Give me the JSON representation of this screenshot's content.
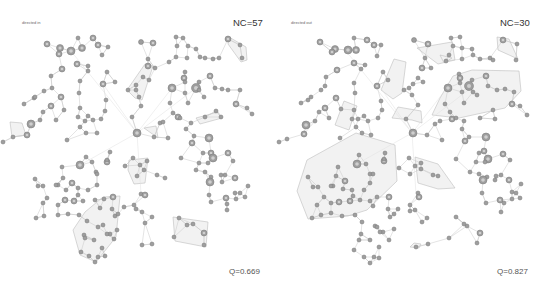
{
  "panels": [
    {
      "title": "directed in",
      "nc_label": "NC=57",
      "q_label": "Q=0.669",
      "hulls": [
        [
          [
            229,
            37
          ],
          [
            246,
            47
          ],
          [
            247,
            60
          ],
          [
            241,
            62
          ],
          [
            228,
            44
          ]
        ],
        [
          [
            145,
            64
          ],
          [
            153,
            66
          ],
          [
            142,
            100
          ],
          [
            135,
            98
          ],
          [
            127,
            90
          ]
        ],
        [
          [
            196,
            118
          ],
          [
            218,
            112
          ],
          [
            222,
            118
          ],
          [
            200,
            124
          ]
        ],
        [
          [
            129,
            160
          ],
          [
            148,
            158
          ],
          [
            145,
            183
          ],
          [
            134,
            184
          ],
          [
            128,
            170
          ]
        ],
        [
          [
            103,
            197
          ],
          [
            120,
            196
          ],
          [
            116,
            237
          ],
          [
            96,
            262
          ],
          [
            80,
            255
          ],
          [
            73,
            230
          ],
          [
            85,
            212
          ]
        ],
        [
          [
            173,
            217
          ],
          [
            208,
            222
          ],
          [
            206,
            247
          ],
          [
            175,
            241
          ]
        ],
        [
          [
            10,
            122
          ],
          [
            22,
            123
          ],
          [
            26,
            135
          ],
          [
            12,
            137
          ]
        ],
        [
          [
            144,
            128
          ],
          [
            156,
            126
          ],
          [
            158,
            138
          ]
        ]
      ],
      "nodes": [
        [
          47,
          44,
          3
        ],
        [
          60,
          48,
          3.5
        ],
        [
          71,
          51,
          4
        ],
        [
          82,
          48,
          3.5
        ],
        [
          78,
          38,
          2
        ],
        [
          59,
          54,
          3
        ],
        [
          62,
          69,
          3
        ],
        [
          77,
          64,
          3
        ],
        [
          93,
          38,
          3
        ],
        [
          98,
          45,
          3
        ],
        [
          108,
          47,
          2
        ],
        [
          102,
          55,
          2
        ],
        [
          88,
          66,
          2
        ],
        [
          80,
          81,
          2
        ],
        [
          79,
          93,
          2
        ],
        [
          88,
          71,
          2
        ],
        [
          51,
          76,
          2
        ],
        [
          44,
          91,
          2
        ],
        [
          34,
          98,
          2
        ],
        [
          35,
          97,
          2
        ],
        [
          52,
          88,
          2
        ],
        [
          61,
          97,
          3
        ],
        [
          64,
          110,
          2
        ],
        [
          51,
          106,
          3
        ],
        [
          43,
          112,
          2
        ],
        [
          56,
          120,
          2
        ],
        [
          40,
          120,
          2
        ],
        [
          24,
          104,
          2
        ],
        [
          103,
          84,
          3
        ],
        [
          107,
          72,
          2
        ],
        [
          115,
          82,
          2
        ],
        [
          106,
          100,
          2
        ],
        [
          105,
          111,
          2
        ],
        [
          80,
          108,
          2
        ],
        [
          88,
          116,
          2
        ],
        [
          85,
          121,
          2
        ],
        [
          93,
          120,
          2
        ],
        [
          101,
          119,
          2
        ],
        [
          78,
          117,
          2
        ],
        [
          80,
          127,
          2
        ],
        [
          141,
          42,
          2.5
        ],
        [
          153,
          43,
          3
        ],
        [
          148,
          59,
          2
        ],
        [
          148,
          66,
          3
        ],
        [
          155,
          68,
          2
        ],
        [
          136,
          90,
          2
        ],
        [
          143,
          77,
          2
        ],
        [
          136,
          85,
          2
        ],
        [
          149,
          80,
          2
        ],
        [
          128,
          90,
          2
        ],
        [
          139,
          97,
          2
        ],
        [
          176,
          37,
          2
        ],
        [
          183,
          38,
          2
        ],
        [
          188,
          46,
          2
        ],
        [
          196,
          49,
          2
        ],
        [
          200,
          57,
          2
        ],
        [
          205,
          58,
          2
        ],
        [
          213,
          59,
          2
        ],
        [
          219,
          58,
          2
        ],
        [
          177,
          46,
          2
        ],
        [
          176,
          57,
          2
        ],
        [
          187,
          58,
          2
        ],
        [
          169,
          62,
          2
        ],
        [
          185,
          72,
          2
        ],
        [
          184,
          78,
          3
        ],
        [
          199,
          82,
          2
        ],
        [
          228,
          39,
          3
        ],
        [
          240,
          45,
          2
        ],
        [
          242,
          58,
          2
        ],
        [
          210,
          76,
          3
        ],
        [
          215,
          88,
          2
        ],
        [
          222,
          89,
          2
        ],
        [
          228,
          90,
          2
        ],
        [
          240,
          90,
          2
        ],
        [
          172,
          88,
          4
        ],
        [
          196,
          88,
          4.5
        ],
        [
          185,
          82,
          2
        ],
        [
          185,
          93,
          2
        ],
        [
          199,
          90,
          2
        ],
        [
          188,
          103,
          2
        ],
        [
          204,
          97,
          2
        ],
        [
          170,
          103,
          2
        ],
        [
          173,
          113,
          2
        ],
        [
          178,
          117,
          3
        ],
        [
          180,
          118,
          2
        ],
        [
          191,
          123,
          2
        ],
        [
          205,
          117,
          2
        ],
        [
          216,
          111,
          2
        ],
        [
          221,
          117,
          2
        ],
        [
          236,
          104,
          3
        ],
        [
          247,
          108,
          2
        ],
        [
          252,
          114,
          2
        ],
        [
          141,
          106,
          2
        ],
        [
          132,
          117,
          2
        ],
        [
          137,
          133,
          4
        ],
        [
          154,
          137,
          2
        ],
        [
          160,
          123,
          2
        ],
        [
          163,
          122,
          2
        ],
        [
          168,
          138,
          2
        ],
        [
          186,
          129,
          2
        ],
        [
          192,
          143,
          3
        ],
        [
          194,
          136,
          2
        ],
        [
          209,
          138,
          4
        ],
        [
          97,
          133,
          2
        ],
        [
          86,
          133,
          2
        ],
        [
          67,
          140,
          2
        ],
        [
          31,
          124,
          4
        ],
        [
          27,
          135,
          3
        ],
        [
          13,
          137,
          2
        ],
        [
          3,
          142,
          2
        ],
        [
          86,
          157,
          2
        ],
        [
          110,
          152,
          2
        ],
        [
          107,
          162,
          3
        ],
        [
          125,
          166,
          2
        ],
        [
          133,
          158,
          2
        ],
        [
          137,
          176,
          2
        ],
        [
          140,
          165,
          2
        ],
        [
          144,
          170,
          2
        ],
        [
          147,
          161,
          2
        ],
        [
          157,
          175,
          2
        ],
        [
          165,
          178,
          2
        ],
        [
          181,
          158,
          2
        ],
        [
          199,
          163,
          2
        ],
        [
          205,
          172,
          2
        ],
        [
          203,
          153,
          2
        ],
        [
          211,
          153,
          3
        ],
        [
          213,
          158,
          4
        ],
        [
          208,
          163,
          2
        ],
        [
          196,
          170,
          2
        ],
        [
          211,
          177,
          2
        ],
        [
          210,
          182,
          4
        ],
        [
          228,
          153,
          3
        ],
        [
          233,
          161,
          2
        ],
        [
          235,
          178,
          3
        ],
        [
          225,
          175,
          2
        ],
        [
          222,
          182,
          2
        ],
        [
          221,
          175,
          2
        ],
        [
          235,
          193,
          2
        ],
        [
          226,
          198,
          3
        ],
        [
          236,
          199,
          2
        ],
        [
          209,
          195,
          2
        ],
        [
          211,
          202,
          2
        ],
        [
          227,
          204,
          2
        ],
        [
          227,
          210,
          2
        ],
        [
          240,
          193,
          2
        ],
        [
          248,
          186,
          2
        ],
        [
          245,
          197,
          2
        ],
        [
          80,
          165,
          4
        ],
        [
          92,
          162,
          2
        ],
        [
          62,
          167,
          2
        ],
        [
          63,
          178,
          2
        ],
        [
          58,
          185,
          2
        ],
        [
          66,
          190,
          2
        ],
        [
          78,
          188,
          2
        ],
        [
          88,
          190,
          2
        ],
        [
          72,
          183,
          3
        ],
        [
          78,
          195,
          2
        ],
        [
          107,
          160,
          2
        ],
        [
          96,
          172,
          2
        ],
        [
          97,
          174,
          2
        ],
        [
          97,
          185,
          2
        ],
        [
          95,
          200,
          2
        ],
        [
          83,
          201,
          2
        ],
        [
          65,
          200,
          3
        ],
        [
          74,
          201,
          3
        ],
        [
          58,
          205,
          2
        ],
        [
          38,
          186,
          2
        ],
        [
          47,
          198,
          2
        ],
        [
          43,
          203,
          2
        ],
        [
          36,
          218,
          2
        ],
        [
          35,
          179,
          2
        ],
        [
          43,
          186,
          2
        ],
        [
          44,
          216,
          2
        ],
        [
          68,
          214,
          2
        ],
        [
          79,
          215,
          2
        ],
        [
          58,
          215,
          2
        ],
        [
          56,
          185,
          2
        ],
        [
          141,
          194,
          2
        ],
        [
          145,
          195,
          3
        ],
        [
          113,
          197,
          3
        ],
        [
          104,
          199,
          2
        ],
        [
          115,
          216,
          2
        ],
        [
          117,
          230,
          2
        ],
        [
          124,
          207,
          2
        ],
        [
          134,
          205,
          2
        ],
        [
          142,
          212,
          2
        ],
        [
          152,
          217,
          2
        ],
        [
          145,
          223,
          2
        ],
        [
          136,
          209,
          2
        ],
        [
          112,
          209,
          2
        ],
        [
          100,
          208,
          2
        ],
        [
          87,
          221,
          2
        ],
        [
          84,
          235,
          2
        ],
        [
          85,
          238,
          2
        ],
        [
          94,
          240,
          2
        ],
        [
          81,
          252,
          2
        ],
        [
          89,
          256,
          2
        ],
        [
          102,
          248,
          2
        ],
        [
          105,
          256,
          2
        ],
        [
          98,
          257,
          2
        ],
        [
          110,
          234,
          2
        ],
        [
          114,
          239,
          2
        ],
        [
          98,
          227,
          2
        ],
        [
          103,
          225,
          2
        ],
        [
          118,
          214,
          2
        ],
        [
          107,
          234,
          2
        ],
        [
          95,
          262,
          2
        ],
        [
          179,
          218,
          2
        ],
        [
          193,
          224,
          2
        ],
        [
          204,
          233,
          3
        ],
        [
          204,
          245,
          2
        ],
        [
          174,
          237,
          2
        ],
        [
          187,
          225,
          2
        ],
        [
          142,
          245,
          2
        ],
        [
          152,
          244,
          2
        ]
      ],
      "edges_from_hub": [
        [
          137,
          133
        ],
        [
          172,
          88
        ],
        [
          196,
          88
        ],
        [
          80,
          165
        ],
        [
          103,
          84
        ],
        [
          71,
          51
        ],
        [
          141,
          194
        ]
      ]
    },
    {
      "title": "directed out",
      "nc_label": "NC=30",
      "q_label": "Q=0.827",
      "hulls": [
        [
          [
            497,
            37
          ],
          [
            509,
            39
          ],
          [
            518,
            59
          ],
          [
            498,
            50
          ]
        ],
        [
          [
            417,
            48
          ],
          [
            452,
            42
          ],
          [
            455,
            60
          ],
          [
            438,
            64
          ],
          [
            430,
            58
          ]
        ],
        [
          [
            440,
            55
          ],
          [
            452,
            58
          ],
          [
            444,
            63
          ]
        ],
        [
          [
            472,
            70
          ],
          [
            519,
            71
          ],
          [
            521,
            91
          ],
          [
            505,
            108
          ],
          [
            459,
            118
          ],
          [
            432,
            115
          ],
          [
            440,
            98
          ],
          [
            453,
            76
          ]
        ],
        [
          [
            398,
            107
          ],
          [
            421,
            111
          ],
          [
            422,
            123
          ],
          [
            412,
            120
          ],
          [
            392,
            118
          ]
        ],
        [
          [
            344,
            101
          ],
          [
            357,
            106
          ],
          [
            349,
            130
          ],
          [
            335,
            125
          ]
        ],
        [
          [
            394,
            59
          ],
          [
            406,
            62
          ],
          [
            402,
            93
          ],
          [
            393,
            99
          ],
          [
            381,
            90
          ]
        ],
        [
          [
            297,
            191
          ],
          [
            307,
            160
          ],
          [
            356,
            133
          ],
          [
            395,
            145
          ],
          [
            397,
            181
          ],
          [
            367,
            210
          ],
          [
            348,
            216
          ],
          [
            308,
            219
          ]
        ],
        [
          [
            415,
            157
          ],
          [
            438,
            164
          ],
          [
            455,
            188
          ],
          [
            438,
            189
          ],
          [
            418,
            183
          ]
        ],
        [
          [
            414,
            243
          ],
          [
            421,
            244
          ],
          [
            419,
            248
          ],
          [
            410,
            247
          ]
        ]
      ]
    }
  ],
  "styles": {
    "node_fill": "#9e9e9e",
    "node_stroke": "#777777",
    "edge_color": "#c8c8c8",
    "hull_fill": "#f2f2f2",
    "hull_stroke": "#bdbdbd"
  }
}
